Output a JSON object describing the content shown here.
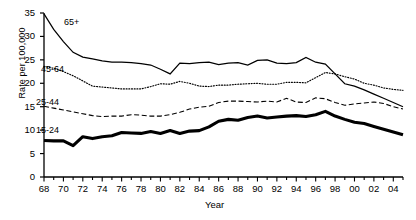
{
  "chart_data": {
    "type": "line",
    "title": "",
    "subtitle": "",
    "xlabel": "Year",
    "ylabel": "Rate per 100,000",
    "xlim": [
      1968,
      2005
    ],
    "ylim": [
      0,
      35
    ],
    "yticks": [
      0,
      5,
      10,
      15,
      20,
      25,
      30,
      35
    ],
    "xticks": [
      "68",
      "70",
      "72",
      "74",
      "76",
      "78",
      "80",
      "82",
      "84",
      "86",
      "88",
      "90",
      "92",
      "94",
      "96",
      "98",
      "00",
      "02",
      "04"
    ],
    "grid": false,
    "legend_position": "inline-annotations",
    "x": [
      1968,
      1969,
      1970,
      1971,
      1972,
      1973,
      1974,
      1975,
      1976,
      1977,
      1978,
      1979,
      1980,
      1981,
      1982,
      1983,
      1984,
      1985,
      1986,
      1987,
      1988,
      1989,
      1990,
      1991,
      1992,
      1993,
      1994,
      1995,
      1996,
      1997,
      1998,
      1999,
      2000,
      2001,
      2002,
      2003,
      2004,
      2005
    ],
    "series": [
      {
        "name": "65+",
        "style": "solid-thin",
        "values": [
          34.8,
          31.5,
          28.9,
          26.6,
          25.6,
          25.2,
          24.8,
          24.5,
          24.5,
          24.4,
          24.2,
          23.9,
          23.0,
          22.0,
          24.3,
          24.2,
          24.4,
          24.5,
          24.0,
          24.3,
          24.4,
          23.9,
          24.9,
          25.0,
          24.3,
          24.2,
          24.4,
          25.5,
          24.5,
          24.1,
          22.0,
          19.9,
          19.4,
          18.6,
          17.7,
          16.8,
          15.9,
          15.0
        ]
      },
      {
        "name": "45-64",
        "style": "dotted",
        "values": [
          23.6,
          23.2,
          22.5,
          21.6,
          20.5,
          19.4,
          19.2,
          19.0,
          18.8,
          18.8,
          18.8,
          19.3,
          19.9,
          19.8,
          20.4,
          20.0,
          19.4,
          19.3,
          19.6,
          19.6,
          19.8,
          19.9,
          20.0,
          19.8,
          19.8,
          20.2,
          20.2,
          20.1,
          21.2,
          22.3,
          22.0,
          21.4,
          20.9,
          20.0,
          19.6,
          19.0,
          18.7,
          18.5
        ]
      },
      {
        "name": "25-44",
        "style": "dashed",
        "values": [
          15.1,
          14.7,
          14.3,
          13.9,
          13.5,
          13.1,
          12.9,
          13.0,
          13.0,
          13.3,
          13.2,
          13.0,
          13.0,
          13.3,
          13.8,
          14.5,
          14.9,
          15.1,
          15.9,
          16.2,
          16.2,
          16.1,
          16.0,
          16.2,
          16.0,
          16.8,
          16.0,
          15.9,
          16.9,
          16.7,
          15.9,
          15.3,
          15.6,
          15.8,
          16.0,
          15.7,
          15.0,
          14.5
        ]
      },
      {
        "name": "15-24",
        "style": "solid-thick",
        "values": [
          7.8,
          7.7,
          7.7,
          6.7,
          8.6,
          8.2,
          8.6,
          8.8,
          9.5,
          9.4,
          9.3,
          9.7,
          9.3,
          9.9,
          9.3,
          9.8,
          9.9,
          10.7,
          11.9,
          12.3,
          12.1,
          12.7,
          13.0,
          12.6,
          12.8,
          13.0,
          13.1,
          12.9,
          13.3,
          14.0,
          13.0,
          12.3,
          11.7,
          11.4,
          10.8,
          10.2,
          9.6,
          9.0
        ]
      }
    ]
  }
}
